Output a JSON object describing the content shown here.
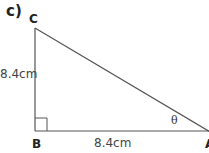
{
  "figure": {
    "part_label": "c)",
    "vertices": {
      "C": "C",
      "B": "B",
      "A": "A"
    },
    "sides": {
      "CB": "8.4cm",
      "BA": "8.4cm"
    },
    "angle_label": "θ",
    "right_angle_at": "B",
    "line_color": "#555555"
  }
}
